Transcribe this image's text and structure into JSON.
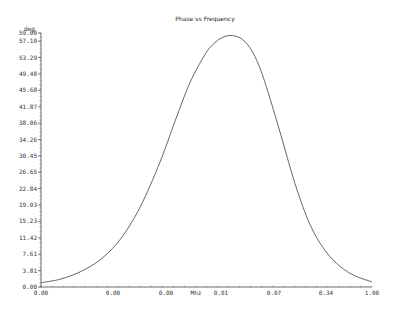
{
  "chart_data": {
    "type": "line",
    "title": "Phase vs Frequency",
    "xlabel": "Mhz",
    "ylabel": "deg",
    "ylim": [
      0,
      59.0
    ],
    "grid": false,
    "legend": null,
    "y_ticks": [
      "0.00",
      "3.81",
      "7.61",
      "11.42",
      "15.23",
      "19.03",
      "22.84",
      "26.65",
      "30.45",
      "34.26",
      "38.06",
      "41.87",
      "45.68",
      "49.48",
      "53.29",
      "57.10",
      "59.00"
    ],
    "x_ticks": [
      "0.00",
      "0.00",
      "0.00",
      "0.01",
      "0.07",
      "0.34",
      "1.00"
    ],
    "x_scale": "log",
    "series": [
      {
        "name": "Phase",
        "color": "#555555",
        "x_px": [
          41,
          60,
          80,
          100,
          120,
          140,
          160,
          175,
          190,
          205,
          215,
          225,
          235,
          245,
          255,
          265,
          280,
          295,
          310,
          325,
          340,
          355,
          372
        ],
        "values": [
          1.0,
          1.8,
          3.5,
          6.3,
          11.0,
          18.5,
          29.0,
          38.5,
          47.5,
          54.0,
          56.8,
          58.2,
          58.3,
          57.0,
          53.5,
          47.5,
          36.0,
          24.0,
          14.5,
          8.5,
          4.8,
          2.6,
          1.2
        ]
      }
    ]
  }
}
